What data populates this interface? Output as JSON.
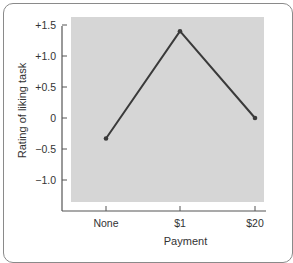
{
  "chart_data": {
    "type": "line",
    "title": "",
    "xlabel": "Payment",
    "ylabel": "Rating of liking task",
    "categories": [
      "None",
      "$1",
      "$20"
    ],
    "series": [
      {
        "name": "Rating",
        "values": [
          -0.33,
          1.4,
          0.0
        ]
      }
    ],
    "ylim": [
      -1.35,
      1.65
    ],
    "yticks": [
      1.5,
      1.0,
      0.5,
      0,
      -0.5,
      -1.0
    ],
    "ytick_labels": [
      "+1.5",
      "+1.0",
      "+0.5",
      "0",
      "−0.5",
      "−1.0"
    ],
    "grid": false,
    "legend": "none",
    "colors": {
      "line": "#3a3a3a",
      "plot_bg": "#d6d6d6",
      "axis": "#555555"
    }
  }
}
